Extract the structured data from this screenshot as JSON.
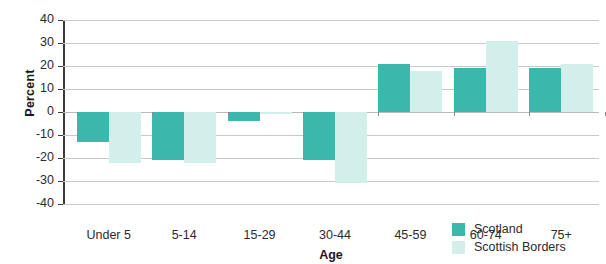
{
  "chart_data": {
    "type": "bar",
    "title": "",
    "xlabel": "Age",
    "ylabel": "Percent",
    "categories": [
      "Under 5",
      "5-14",
      "15-29",
      "30-44",
      "45-59",
      "60-74",
      "75+"
    ],
    "series": [
      {
        "name": "Scotland",
        "color": "#3bb7ab",
        "values": [
          -13,
          -21,
          -4,
          -21,
          21,
          19,
          19
        ]
      },
      {
        "name": "Scottish Borders",
        "color": "#d3efeb",
        "values": [
          -22,
          -22,
          -1,
          -31,
          18,
          31,
          21
        ]
      }
    ],
    "ylim": [
      -40,
      40
    ],
    "yticks": [
      40,
      30,
      20,
      10,
      0,
      -10,
      -20,
      -30,
      -40
    ],
    "ytick_labels": [
      "40",
      "30",
      "20",
      "10",
      "0",
      "-10",
      "-20",
      "-30",
      "-40"
    ],
    "grid": true,
    "legend_position": "bottom-right"
  },
  "legend": {
    "items": [
      {
        "label": "Scotland",
        "color": "#3bb7ab"
      },
      {
        "label": "Scottish Borders",
        "color": "#d3efeb"
      }
    ]
  }
}
